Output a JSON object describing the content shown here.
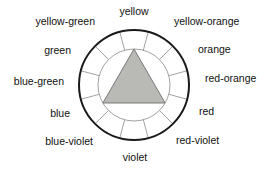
{
  "diagram": {
    "type": "color-wheel",
    "center": {
      "x": 134,
      "y": 85
    },
    "outer_radius": 55,
    "inner_radius": 36,
    "segment_count": 12,
    "colors": {
      "outline": "#1a1a1a",
      "spoke": "#8a8a8a",
      "inner_circle": "#8a8a8a",
      "triangle_fill": "#b9b9b6",
      "triangle_stroke": "#6e6e6e",
      "background": "#ffffff",
      "text": "#111111"
    },
    "triangle": {
      "name": "primary-triangle",
      "fill": "#b9b9b6",
      "orientation": "apex-up"
    },
    "segments": [
      {
        "label": "yellow",
        "angle_deg": 0,
        "anchor": "center",
        "lx": 134,
        "ly": 11
      },
      {
        "label": "yellow-orange",
        "angle_deg": 30,
        "anchor": "left",
        "lx": 174,
        "ly": 21
      },
      {
        "label": "orange",
        "angle_deg": 60,
        "anchor": "left",
        "lx": 198,
        "ly": 49
      },
      {
        "label": "red-orange",
        "angle_deg": 90,
        "anchor": "left",
        "lx": 205,
        "ly": 78
      },
      {
        "label": "red",
        "angle_deg": 120,
        "anchor": "left",
        "lx": 199,
        "ly": 111
      },
      {
        "label": "red-violet",
        "angle_deg": 150,
        "anchor": "left",
        "lx": 176,
        "ly": 140
      },
      {
        "label": "violet",
        "angle_deg": 180,
        "anchor": "center",
        "lx": 135,
        "ly": 157
      },
      {
        "label": "blue-violet",
        "angle_deg": 210,
        "anchor": "right",
        "lx": 93,
        "ly": 141
      },
      {
        "label": "blue",
        "angle_deg": 240,
        "anchor": "right",
        "lx": 70,
        "ly": 113
      },
      {
        "label": "blue-green",
        "angle_deg": 270,
        "anchor": "right",
        "lx": 64,
        "ly": 81
      },
      {
        "label": "green",
        "angle_deg": 300,
        "anchor": "right",
        "lx": 71,
        "ly": 50
      },
      {
        "label": "yellow-green",
        "angle_deg": 330,
        "anchor": "right",
        "lx": 95,
        "ly": 21
      }
    ]
  }
}
